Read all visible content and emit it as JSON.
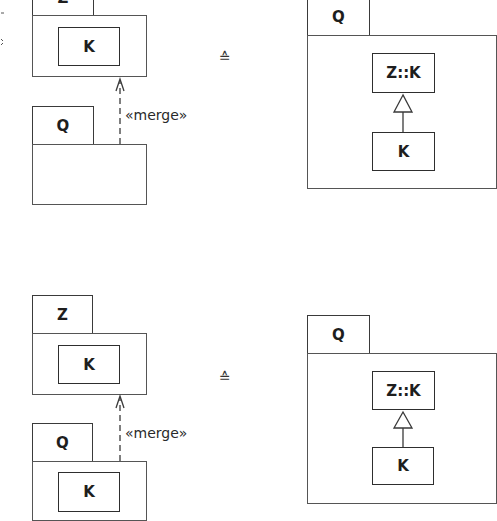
{
  "diagrams": [
    {
      "left": {
        "target_package": {
          "name": "Z",
          "classes": [
            "K"
          ]
        },
        "source_package": {
          "name": "Q",
          "classes": []
        },
        "relationship": "«merge»"
      },
      "equivalence_symbol": "≙",
      "right": {
        "package": {
          "name": "Q"
        },
        "general_class": "Z::K",
        "specific_class": "K",
        "relationship": "generalization"
      }
    },
    {
      "left": {
        "target_package": {
          "name": "Z",
          "classes": [
            "K"
          ]
        },
        "source_package": {
          "name": "Q",
          "classes": [
            "K"
          ]
        },
        "relationship": "«merge»"
      },
      "equivalence_symbol": "≙",
      "right": {
        "package": {
          "name": "Q"
        },
        "general_class": "Z::K",
        "specific_class": "K",
        "relationship": "generalization"
      }
    }
  ],
  "colors": {
    "line": "#3a3a3a",
    "background": "#ffffff",
    "text": "#1e1e1e"
  }
}
